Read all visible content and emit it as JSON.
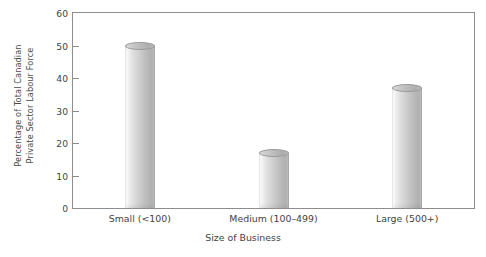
{
  "chart_data": {
    "type": "bar",
    "title": "",
    "subtitle": "",
    "xlabel": "Size of Business",
    "ylabel_line1": "Percentage of Total Canadian",
    "ylabel_line2": "Private Sector Labour Force",
    "ylabel": "Percentage of Total Canadian Private Sector Labour Force",
    "categories": [
      "Small (<100)",
      "Medium (100–499)",
      "Large (500+)"
    ],
    "values": [
      50,
      17,
      37
    ],
    "ylim": [
      0,
      60
    ],
    "ytick_values": [
      0,
      10,
      20,
      30,
      40,
      50,
      60
    ],
    "ytick_labels": [
      "0",
      "10",
      "20",
      "30",
      "40",
      "50",
      "60"
    ],
    "grid": false,
    "legend": false,
    "legend_position": "none",
    "bar_style": "3d-cylinder",
    "bar_color": "#c6c6c6",
    "frame_color": "#8d8d8d",
    "background_color": "#ffffff",
    "text_color": "#3f3f3f"
  }
}
